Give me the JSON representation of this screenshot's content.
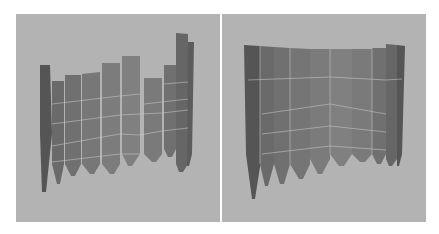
{
  "figure": {
    "background_color": "#ffffff",
    "panel_color": "#b3b3b3",
    "grid_line_color": "#c9c9c9",
    "panels": [
      {
        "id": "left",
        "view": "strips at differing heights arranged in a curved row",
        "strip_count": 10
      },
      {
        "id": "right",
        "view": "strips aligned at top forming a curved sheet",
        "strip_count": 10
      }
    ]
  }
}
